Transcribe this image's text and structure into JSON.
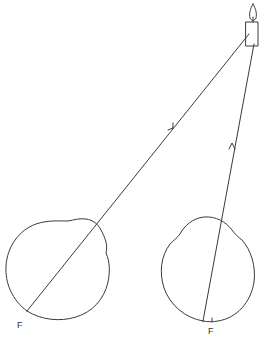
{
  "diagram": {
    "colors": {
      "stroke": "#3a3a3a",
      "background": "#ffffff"
    },
    "objects": {
      "candle": {
        "label": "",
        "icon": "candle-icon"
      }
    },
    "eyes": [
      {
        "id": "left-eye",
        "focus_label": "F"
      },
      {
        "id": "right-eye",
        "focus_label": "F"
      }
    ],
    "rays": [
      {
        "id": "ray-left",
        "from": "candle",
        "to": "left-eye",
        "arrow": "toward candle"
      },
      {
        "id": "ray-right",
        "from": "candle",
        "to": "right-eye",
        "arrow": "toward candle"
      }
    ]
  }
}
